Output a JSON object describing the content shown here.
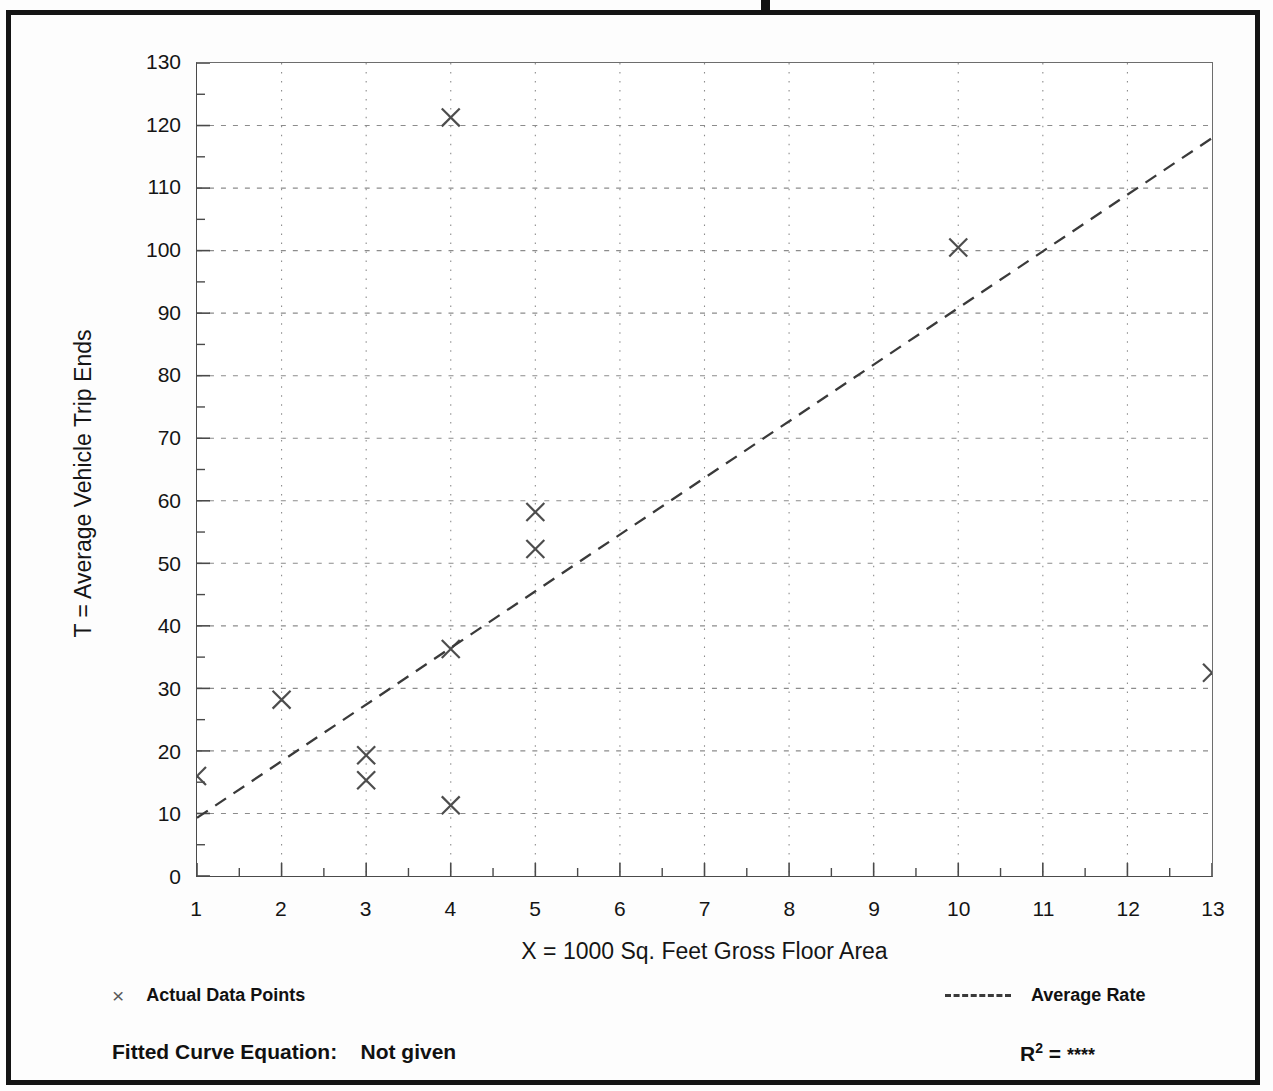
{
  "chart_data": {
    "type": "scatter",
    "title": "",
    "xlabel": "X = 1000 Sq. Feet Gross Floor Area",
    "ylabel": "T = Average Vehicle Trip Ends",
    "xlim": [
      1,
      13
    ],
    "ylim": [
      0,
      130
    ],
    "grid": true,
    "x_ticks": [
      1,
      2,
      3,
      4,
      5,
      6,
      7,
      8,
      9,
      10,
      11,
      12,
      13
    ],
    "x_tick_labels": [
      "1",
      "2",
      "3",
      "4",
      "5",
      "6",
      "7",
      "8",
      "9",
      "10",
      "11",
      "12",
      "13"
    ],
    "x_minor_tick_step": 0.5,
    "y_ticks": [
      0,
      10,
      20,
      30,
      40,
      50,
      60,
      70,
      80,
      90,
      100,
      110,
      120,
      130
    ],
    "y_tick_labels": [
      "0",
      "10",
      "20",
      "30",
      "40",
      "50",
      "60",
      "70",
      "80",
      "90",
      "100",
      "110",
      "120",
      "130"
    ],
    "y_minor_tick_step": 5,
    "legend_position": "below-plot",
    "series": [
      {
        "name": "Actual Data Points",
        "type": "scatter",
        "marker": "x",
        "color": "#4d4d4d",
        "points": [
          {
            "x": 1,
            "y": 16.0
          },
          {
            "x": 2,
            "y": 28.2
          },
          {
            "x": 3,
            "y": 19.3
          },
          {
            "x": 3,
            "y": 15.3
          },
          {
            "x": 4,
            "y": 121.3
          },
          {
            "x": 4,
            "y": 36.3
          },
          {
            "x": 4,
            "y": 11.3
          },
          {
            "x": 5,
            "y": 58.2
          },
          {
            "x": 5,
            "y": 52.3
          },
          {
            "x": 10,
            "y": 100.5
          },
          {
            "x": 13,
            "y": 32.5
          }
        ]
      },
      {
        "name": "Average Rate",
        "type": "line",
        "style": "dashed",
        "color": "#3a3a3a",
        "endpoints": [
          {
            "x": 1,
            "y": 9.3
          },
          {
            "x": 13,
            "y": 118.0
          }
        ]
      }
    ]
  },
  "legend": {
    "data_points_label": "Actual Data Points",
    "data_points_marker": "×",
    "average_rate_label": "Average Rate"
  },
  "footer": {
    "equation_label": "Fitted Curve Equation:",
    "equation_value": "Not given",
    "r2_label": "R",
    "r2_exponent": "2",
    "r2_equals": "=",
    "r2_value": "****"
  }
}
